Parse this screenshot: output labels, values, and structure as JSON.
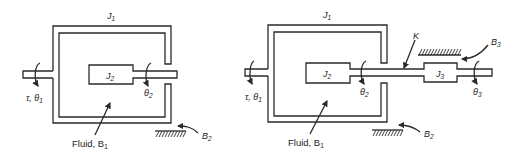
{
  "figure": {
    "left_system": {
      "outer_inertia_label": "J",
      "outer_inertia_sub": "1",
      "inner_inertia_label": "J",
      "inner_inertia_sub": "2",
      "input_label": "τ, θ",
      "input_sub": "1",
      "output_angle_label": "θ",
      "output_angle_sub": "2",
      "fluid_label": "Fluid, B",
      "fluid_sub": "1",
      "bearing_label": "B",
      "bearing_sub": "2"
    },
    "right_system": {
      "outer_inertia_label": "J",
      "outer_inertia_sub": "1",
      "inner_inertia_label": "J",
      "inner_inertia_sub": "2",
      "third_inertia_label": "J",
      "third_inertia_sub": "3",
      "input_label": "τ, θ",
      "input_sub": "1",
      "angle2_label": "θ",
      "angle2_sub": "2",
      "angle3_label": "θ",
      "angle3_sub": "3",
      "spring_label": "K",
      "fluid_label": "Fluid, B",
      "fluid_sub": "1",
      "bearing2_label": "B",
      "bearing2_sub": "2",
      "bearing3_label": "B",
      "bearing3_sub": "3"
    },
    "colors": {
      "line": "#2a2a2a",
      "background": "#ffffff"
    }
  }
}
